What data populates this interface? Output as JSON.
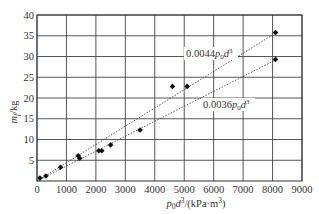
{
  "chart_data": {
    "type": "scatter",
    "title": "",
    "xlabel": "p0d3/(kPa·m3)",
    "ylabel": "mf/kg",
    "xlim": [
      0,
      9000
    ],
    "ylim": [
      0,
      40
    ],
    "grid": true,
    "legend": null,
    "x_ticks": [
      0,
      1000,
      2000,
      3000,
      4000,
      5000,
      6000,
      7000,
      8000,
      9000
    ],
    "y_ticks": [
      5,
      10,
      15,
      20,
      25,
      30,
      35,
      40
    ],
    "x_tick_labels": [
      "0",
      "1000",
      "2000",
      "3000",
      "4000",
      "5000",
      "6000",
      "7000",
      "8000",
      "9000"
    ],
    "y_tick_labels": [
      "5",
      "10",
      "15",
      "20",
      "25",
      "30",
      "35",
      "40"
    ],
    "series": [
      {
        "name": "measured",
        "marker": "diamond",
        "color": "#111111",
        "x": [
          100,
          300,
          800,
          1400,
          1450,
          2100,
          2200,
          2500,
          3500,
          4600,
          5100,
          8100,
          8100
        ],
        "y": [
          0.7,
          1.2,
          3.3,
          6.1,
          5.5,
          7.3,
          7.3,
          8.7,
          12.3,
          22.8,
          22.8,
          35.8,
          29.3
        ]
      }
    ],
    "fit_lines": [
      {
        "label": "0.0044p0d3",
        "slope": 0.0044,
        "style": "dotted",
        "x_range": [
          0,
          8100
        ]
      },
      {
        "label": "0.0036p0d3",
        "slope": 0.0036,
        "style": "dotted",
        "x_range": [
          0,
          8100
        ]
      }
    ],
    "annotations": [
      {
        "text": "0.0044p0d3",
        "x": 6300,
        "y": 31.5,
        "target": "fit_lines.0"
      },
      {
        "text": "0.0036p0d3",
        "x": 7000,
        "y": 20.0,
        "target": "fit_lines.1"
      }
    ]
  },
  "labels": {
    "ylabel_main": "m",
    "ylabel_sub": "f",
    "ylabel_unit": "/kg",
    "xlabel_p": "p",
    "xlabel_sub": "0",
    "xlabel_d": "d",
    "xlabel_sup": "3",
    "xlabel_unit": "/(kPa·m",
    "xlabel_unit_sup": "3",
    "xlabel_close": ")",
    "annot1_coef": "0.0044",
    "annot2_coef": "0.0036"
  }
}
